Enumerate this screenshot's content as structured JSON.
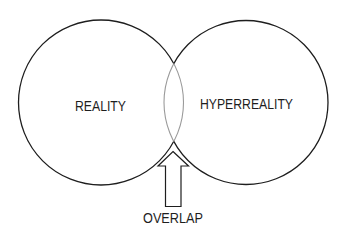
{
  "diagram": {
    "type": "venn",
    "sets": [
      {
        "id": "left",
        "label": "REALITY"
      },
      {
        "id": "right",
        "label": "HYPERREALITY"
      }
    ],
    "overlap": {
      "label": "OVERLAP",
      "pointer": "arrow-up"
    },
    "colors": {
      "background": "#ffffff",
      "outline": "#1e1e1e",
      "overlap_outline": "#9a9a9a",
      "text": "#1e1e1e"
    }
  }
}
